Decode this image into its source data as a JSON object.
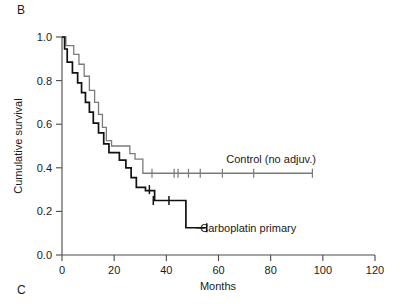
{
  "panels": {
    "current_label": "B",
    "next_label": "C"
  },
  "chart_data": {
    "type": "line",
    "subtype": "kaplan-meier-step",
    "title": "",
    "xlabel": "Months",
    "ylabel": "Cumulative survival",
    "xlim": [
      0,
      120
    ],
    "ylim": [
      0.0,
      1.0
    ],
    "xticks": [
      0,
      20,
      40,
      60,
      80,
      100,
      120
    ],
    "xtick_labels": [
      "0",
      "20",
      "40",
      "60",
      "80",
      "100",
      "120"
    ],
    "yticks": [
      0.0,
      0.2,
      0.4,
      0.6,
      0.8,
      1.0
    ],
    "ytick_labels": [
      "0.0",
      "0.2",
      "0.4",
      "0.6",
      "0.8",
      "1.0"
    ],
    "grid": false,
    "legend_position": "inline-annotation",
    "series": [
      {
        "name": "Control (no adjuv.)",
        "color": "#7a7a7a",
        "label_x": 63,
        "label_y": 0.44,
        "plateau_value": 0.375,
        "points": [
          [
            0,
            1.0
          ],
          [
            1.5,
            1.0
          ],
          [
            1.5,
            0.96
          ],
          [
            4.5,
            0.96
          ],
          [
            4.5,
            0.92
          ],
          [
            6.5,
            0.92
          ],
          [
            6.5,
            0.875
          ],
          [
            8.5,
            0.875
          ],
          [
            8.5,
            0.82
          ],
          [
            10.5,
            0.82
          ],
          [
            10.5,
            0.755
          ],
          [
            12.5,
            0.755
          ],
          [
            12.5,
            0.7
          ],
          [
            14.0,
            0.7
          ],
          [
            14.0,
            0.645
          ],
          [
            15.5,
            0.645
          ],
          [
            15.5,
            0.585
          ],
          [
            17.0,
            0.585
          ],
          [
            17.0,
            0.525
          ],
          [
            19.0,
            0.525
          ],
          [
            19.0,
            0.5
          ],
          [
            26.0,
            0.5
          ],
          [
            26.0,
            0.465
          ],
          [
            28.0,
            0.465
          ],
          [
            28.0,
            0.44
          ],
          [
            31.0,
            0.44
          ],
          [
            31.0,
            0.375
          ],
          [
            96.0,
            0.375
          ]
        ],
        "censor_marks": [
          [
            34.5,
            0.375
          ],
          [
            43.0,
            0.375
          ],
          [
            44.5,
            0.375
          ],
          [
            48.5,
            0.375
          ],
          [
            53.0,
            0.375
          ],
          [
            61.5,
            0.375
          ],
          [
            73.5,
            0.375
          ],
          [
            96.0,
            0.375
          ]
        ]
      },
      {
        "name": "Carboplatin primary",
        "color": "#111111",
        "label_x": 53,
        "label_y": 0.125,
        "plateau_value": 0.125,
        "points": [
          [
            0,
            1.0
          ],
          [
            1.0,
            1.0
          ],
          [
            1.0,
            0.945
          ],
          [
            2.0,
            0.945
          ],
          [
            2.0,
            0.885
          ],
          [
            4.0,
            0.885
          ],
          [
            4.0,
            0.835
          ],
          [
            6.0,
            0.835
          ],
          [
            6.0,
            0.79
          ],
          [
            7.5,
            0.79
          ],
          [
            7.5,
            0.745
          ],
          [
            9.0,
            0.745
          ],
          [
            9.0,
            0.7
          ],
          [
            10.5,
            0.7
          ],
          [
            10.5,
            0.655
          ],
          [
            12.0,
            0.655
          ],
          [
            12.0,
            0.605
          ],
          [
            14.0,
            0.605
          ],
          [
            14.0,
            0.56
          ],
          [
            16.0,
            0.56
          ],
          [
            16.0,
            0.51
          ],
          [
            18.0,
            0.51
          ],
          [
            18.0,
            0.47
          ],
          [
            22.0,
            0.47
          ],
          [
            22.0,
            0.435
          ],
          [
            24.5,
            0.435
          ],
          [
            24.5,
            0.4
          ],
          [
            26.5,
            0.4
          ],
          [
            26.5,
            0.355
          ],
          [
            28.5,
            0.355
          ],
          [
            28.5,
            0.31
          ],
          [
            32.0,
            0.31
          ],
          [
            32.0,
            0.295
          ],
          [
            35.5,
            0.295
          ],
          [
            35.5,
            0.25
          ],
          [
            47.5,
            0.25
          ],
          [
            47.5,
            0.125
          ],
          [
            55.5,
            0.125
          ]
        ],
        "censor_marks": [
          [
            33.5,
            0.3
          ],
          [
            35.0,
            0.25
          ],
          [
            41.0,
            0.25
          ],
          [
            55.5,
            0.125
          ]
        ]
      }
    ]
  }
}
